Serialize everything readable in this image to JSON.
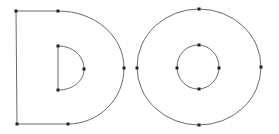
{
  "diagram": {
    "stroke_color": "#6a6a6a",
    "point_color": "#222222",
    "background": "#ffffff",
    "glyphs": [
      {
        "char": "D",
        "outer_contour": {
          "points": [
            [
              16,
              11
            ],
            [
              58,
              11
            ],
            [
              124,
              68
            ],
            [
              68,
              124
            ],
            [
              17,
              124
            ]
          ]
        },
        "inner_contour": {
          "points": [
            [
              58,
              46
            ],
            [
              84,
              69
            ],
            [
              58,
              90
            ]
          ]
        }
      },
      {
        "char": "O",
        "outer_contour": {
          "center": [
            199,
            67
          ],
          "rx": 62,
          "ry": 58,
          "points": [
            [
              199,
              9
            ],
            [
              261,
              67
            ],
            [
              199,
              125
            ],
            [
              137,
              68
            ]
          ]
        },
        "inner_contour": {
          "center": [
            198,
            67
          ],
          "rx": 21,
          "ry": 22,
          "points": [
            [
              199,
              45
            ],
            [
              219,
              68
            ],
            [
              199,
              89
            ],
            [
              177,
              68
            ]
          ]
        }
      }
    ]
  }
}
